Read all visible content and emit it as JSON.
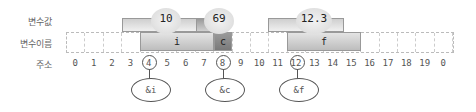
{
  "labels": {
    "value": "변수값",
    "name": "변수이름",
    "address": "주소"
  },
  "addresses": [
    "0",
    "1",
    "2",
    "3",
    "4",
    "5",
    "6",
    "7",
    "8",
    "9",
    "10",
    "11",
    "12",
    "13",
    "14",
    "15",
    "16",
    "17",
    "18",
    "19",
    "0"
  ],
  "variables": [
    {
      "name": "i",
      "value": "10",
      "start": 4,
      "size": 4,
      "ref": "&i",
      "color": "#c8c8c8"
    },
    {
      "name": "c",
      "value": "69",
      "start": 8,
      "size": 1,
      "ref": "&c",
      "color": "#8a8a8a"
    },
    {
      "name": "f",
      "value": "12.3",
      "start": 12,
      "size": 4,
      "ref": "&f",
      "color": "#c8c8c8"
    }
  ]
}
